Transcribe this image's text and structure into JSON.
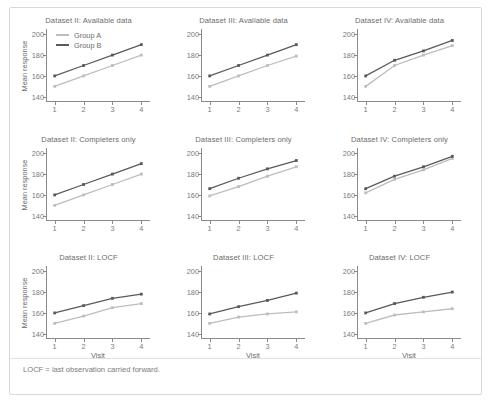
{
  "figure": {
    "footnote": "LOCF = last observation carried forward.",
    "legend": {
      "group_a_label": "Group A",
      "group_b_label": "Group B",
      "group_a_color": "#bdbdbd",
      "group_b_color": "#5a5a5a",
      "position": "top-left of first panel"
    },
    "axis": {
      "ylabel": "Mean response",
      "xlabel": "Visit",
      "yticks": [
        140,
        160,
        180,
        200
      ],
      "xticks": [
        1,
        2,
        3,
        4
      ],
      "ylim": [
        135,
        205
      ],
      "xlim": [
        0.7,
        4.3
      ],
      "grid": false
    }
  },
  "chart_data": [
    {
      "type": "line",
      "title": "Dataset II: Available data",
      "xlabel": "",
      "ylabel": "Mean response",
      "x": [
        1,
        2,
        3,
        4
      ],
      "xticklabels": [
        "1",
        "2",
        "3",
        "4"
      ],
      "yticks": [
        140,
        160,
        180,
        200
      ],
      "ylim": [
        135,
        205
      ],
      "series": [
        {
          "name": "Group A",
          "values": [
            150,
            160,
            170,
            180
          ],
          "color": "#bdbdbd"
        },
        {
          "name": "Group B",
          "values": [
            160,
            170,
            180,
            190
          ],
          "color": "#5a5a5a"
        }
      ]
    },
    {
      "type": "line",
      "title": "Dataset III: Available data",
      "xlabel": "",
      "ylabel": "",
      "x": [
        1,
        2,
        3,
        4
      ],
      "xticklabels": [
        "1",
        "2",
        "3",
        "4"
      ],
      "yticks": [
        140,
        160,
        180,
        200
      ],
      "ylim": [
        135,
        205
      ],
      "series": [
        {
          "name": "Group A",
          "values": [
            150,
            160,
            170,
            179
          ],
          "color": "#bdbdbd"
        },
        {
          "name": "Group B",
          "values": [
            160,
            170,
            180,
            190
          ],
          "color": "#5a5a5a"
        }
      ]
    },
    {
      "type": "line",
      "title": "Dataset IV: Available data",
      "xlabel": "",
      "ylabel": "",
      "x": [
        1,
        2,
        3,
        4
      ],
      "xticklabels": [
        "1",
        "2",
        "3",
        "4"
      ],
      "yticks": [
        140,
        160,
        180,
        200
      ],
      "ylim": [
        135,
        205
      ],
      "series": [
        {
          "name": "Group A",
          "values": [
            150,
            170,
            180,
            189
          ],
          "color": "#bdbdbd"
        },
        {
          "name": "Group B",
          "values": [
            160,
            175,
            184,
            194
          ],
          "color": "#5a5a5a"
        }
      ]
    },
    {
      "type": "line",
      "title": "Dataset II: Completers only",
      "xlabel": "",
      "ylabel": "Mean response",
      "x": [
        1,
        2,
        3,
        4
      ],
      "xticklabels": [
        "1",
        "2",
        "3",
        "4"
      ],
      "yticks": [
        140,
        160,
        180,
        200
      ],
      "ylim": [
        135,
        205
      ],
      "series": [
        {
          "name": "Group A",
          "values": [
            150,
            160,
            170,
            180
          ],
          "color": "#bdbdbd"
        },
        {
          "name": "Group B",
          "values": [
            160,
            170,
            180,
            190
          ],
          "color": "#5a5a5a"
        }
      ]
    },
    {
      "type": "line",
      "title": "Dataset III: Completers only",
      "xlabel": "",
      "ylabel": "",
      "x": [
        1,
        2,
        3,
        4
      ],
      "xticklabels": [
        "1",
        "2",
        "3",
        "4"
      ],
      "yticks": [
        140,
        160,
        180,
        200
      ],
      "ylim": [
        135,
        205
      ],
      "series": [
        {
          "name": "Group A",
          "values": [
            159,
            168,
            178,
            187
          ],
          "color": "#bdbdbd"
        },
        {
          "name": "Group B",
          "values": [
            166,
            176,
            185,
            193
          ],
          "color": "#5a5a5a"
        }
      ]
    },
    {
      "type": "line",
      "title": "Dataset IV: Completers only",
      "xlabel": "",
      "ylabel": "",
      "x": [
        1,
        2,
        3,
        4
      ],
      "xticklabels": [
        "1",
        "2",
        "3",
        "4"
      ],
      "yticks": [
        140,
        160,
        180,
        200
      ],
      "ylim": [
        135,
        205
      ],
      "series": [
        {
          "name": "Group A",
          "values": [
            162,
            175,
            184,
            195
          ],
          "color": "#bdbdbd"
        },
        {
          "name": "Group B",
          "values": [
            166,
            178,
            187,
            197
          ],
          "color": "#5a5a5a"
        }
      ]
    },
    {
      "type": "line",
      "title": "Dataset II: LOCF",
      "xlabel": "Visit",
      "ylabel": "Mean response",
      "x": [
        1,
        2,
        3,
        4
      ],
      "xticklabels": [
        "1",
        "2",
        "3",
        "4"
      ],
      "yticks": [
        140,
        160,
        180,
        200
      ],
      "ylim": [
        135,
        205
      ],
      "series": [
        {
          "name": "Group A",
          "values": [
            150,
            157,
            165,
            169
          ],
          "color": "#bdbdbd"
        },
        {
          "name": "Group B",
          "values": [
            160,
            167,
            174,
            178
          ],
          "color": "#5a5a5a"
        }
      ]
    },
    {
      "type": "line",
      "title": "Dataset III: LOCF",
      "xlabel": "Visit",
      "ylabel": "",
      "x": [
        1,
        2,
        3,
        4
      ],
      "xticklabels": [
        "1",
        "2",
        "3",
        "4"
      ],
      "yticks": [
        140,
        160,
        180,
        200
      ],
      "ylim": [
        135,
        205
      ],
      "series": [
        {
          "name": "Group A",
          "values": [
            150,
            156,
            159,
            161
          ],
          "color": "#bdbdbd"
        },
        {
          "name": "Group B",
          "values": [
            159,
            166,
            172,
            179
          ],
          "color": "#5a5a5a"
        }
      ]
    },
    {
      "type": "line",
      "title": "Dataset IV: LOCF",
      "xlabel": "Visit",
      "ylabel": "",
      "x": [
        1,
        2,
        3,
        4
      ],
      "xticklabels": [
        "1",
        "2",
        "3",
        "4"
      ],
      "yticks": [
        140,
        160,
        180,
        200
      ],
      "ylim": [
        135,
        205
      ],
      "series": [
        {
          "name": "Group A",
          "values": [
            150,
            158,
            161,
            164
          ],
          "color": "#bdbdbd"
        },
        {
          "name": "Group B",
          "values": [
            160,
            169,
            175,
            180
          ],
          "color": "#5a5a5a"
        }
      ]
    }
  ]
}
